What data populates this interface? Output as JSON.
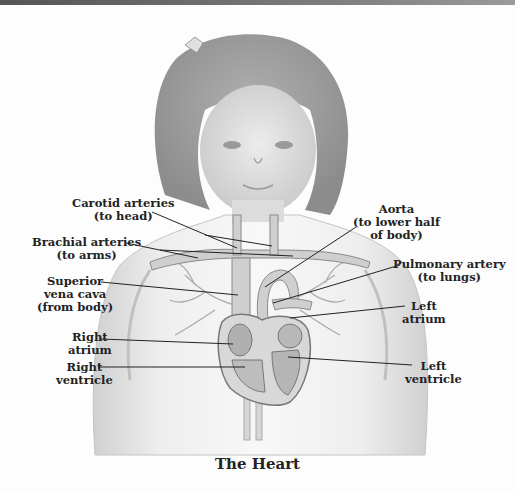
{
  "title": "The Heart",
  "labels": {
    "carotid": {
      "line1": "Carotid arteries",
      "line2": "(to head)"
    },
    "brachial": {
      "line1": "Brachial arteries",
      "line2": "(to arms)"
    },
    "svc": {
      "line1": "Superior",
      "line2": "vena cava",
      "line3": "(from body)"
    },
    "right_atrium": {
      "line1": "Right",
      "line2": "atrium"
    },
    "right_ventricle": {
      "line1": "Right",
      "line2": "ventricle"
    },
    "aorta": {
      "line1": "Aorta",
      "line2": "(to lower half",
      "line3": "of body)"
    },
    "pulmonary": {
      "line1": "Pulmonary artery",
      "line2": "(to lungs)"
    },
    "left_atrium": {
      "line1": "Left",
      "line2": "atrium"
    },
    "left_ventricle": {
      "line1": "Left",
      "line2": "ventricle"
    }
  },
  "colors": {
    "ink": "#222222",
    "skin": "#e6e6e6",
    "hair": "#9a9a9a",
    "heart": "#b5b5b5"
  }
}
